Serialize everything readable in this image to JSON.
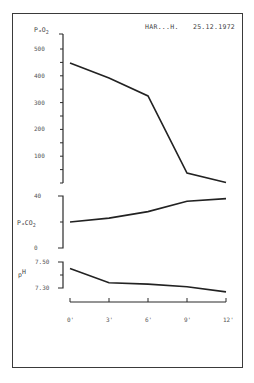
{
  "header": {
    "patient": "HAR...H.",
    "date": "25.12.1972"
  },
  "chart_data": [
    {
      "type": "line",
      "title": "PaO2",
      "ylabel": "PaO2",
      "xlabel": "",
      "x": [
        "0'",
        "3'",
        "6'",
        "9'",
        "12'"
      ],
      "values": [
        448,
        392,
        325,
        37,
        2
      ],
      "ytick_labels": [
        "500",
        "400",
        "300",
        "200",
        "100"
      ],
      "yticks": [
        500,
        400,
        300,
        200,
        100
      ],
      "ylim": [
        0,
        500
      ],
      "grid": false
    },
    {
      "type": "line",
      "title": "PaCO2",
      "ylabel": "PaCO2",
      "x": [
        "0'",
        "3'",
        "6'",
        "9'",
        "12'"
      ],
      "values": [
        20,
        23,
        28,
        36,
        38
      ],
      "ytick_labels": [
        "40",
        "0"
      ],
      "yticks": [
        40,
        0
      ],
      "ylim": [
        0,
        40
      ],
      "grid": false
    },
    {
      "type": "line",
      "title": "pH",
      "ylabel": "pH",
      "x": [
        "0'",
        "3'",
        "6'",
        "9'",
        "12'"
      ],
      "values": [
        7.45,
        7.34,
        7.33,
        7.31,
        7.27
      ],
      "ytick_labels": [
        "7.50",
        "7.30"
      ],
      "yticks": [
        7.5,
        7.3
      ],
      "ylim": [
        7.3,
        7.5
      ],
      "grid": false
    }
  ],
  "axes": {
    "pao2_label_main": "PₐO",
    "pao2_label_sub": "2",
    "paco2_label_main": "PₐCO",
    "paco2_label_sub": "2",
    "ph_label_p": "p",
    "ph_label_h": "H",
    "time_labels": [
      "0'",
      "3'",
      "6'",
      "9'",
      "12'"
    ]
  },
  "colors": {
    "line": "#222222",
    "axis": "#2a2a2a",
    "text": "#555555"
  }
}
